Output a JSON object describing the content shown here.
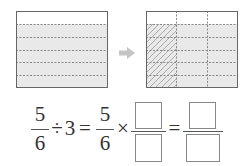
{
  "diagram": {
    "left_rect": {
      "rows": 6,
      "cols": 1,
      "shaded_rows": 5,
      "fill": "#e8e8e8",
      "border": "#666666"
    },
    "arrow": {
      "icon": "right-arrow-icon",
      "color": "#bfbfbf"
    },
    "right_rect": {
      "rows": 6,
      "cols": 3,
      "shaded_rows": 5,
      "hatched_cols": 1,
      "fill": "#e8e8e8",
      "border": "#666666"
    }
  },
  "equation": {
    "f1_num": "5",
    "f1_den": "6",
    "divide": "÷",
    "divisor": "3",
    "equals1": "=",
    "f2_num": "5",
    "f2_den": "6",
    "times": "×",
    "equals2": "=",
    "blank_boxes": 4
  }
}
